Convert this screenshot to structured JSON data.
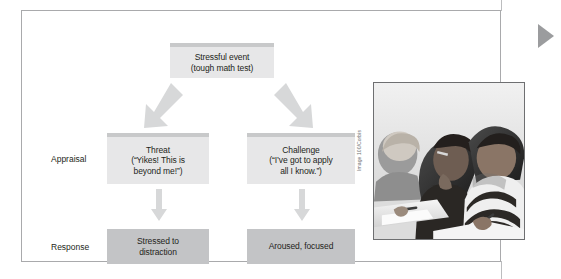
{
  "figure": {
    "row_labels": {
      "appraisal": "Appraisal",
      "response": "Response"
    },
    "boxes": {
      "stressful_event": "Stressful event\n(tough math test)",
      "threat": "Threat\n(“Yikes! This is\nbeyond me!”)",
      "challenge": "Challenge\n(“I’ve got to apply\nall I know.”)",
      "stressed": "Stressed to\ndistraction",
      "aroused": "Aroused, focused"
    },
    "photo": {
      "alt": "Students bent over desks writing a test",
      "credit": "Image 100/Corbis"
    },
    "colors": {
      "box_light": "#e7e7e8",
      "box_light_cap": "#c8c9ca",
      "box_dark": "#c3c4c6",
      "arrow": "#d7d8d9",
      "frame_border": "#a9aaac",
      "marker": "#9b9c9e",
      "text": "#231f20"
    }
  }
}
